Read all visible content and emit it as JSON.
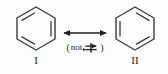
{
  "figure": {
    "type": "resonance-structure-diagram",
    "background_color": "#fdfdfd",
    "stroke_color": "#3a3a3a",
    "text_color": "#222222"
  },
  "structures": [
    {
      "id": "I",
      "name": "benzene-kekule-structure-1",
      "label": "I",
      "molecule": "benzene",
      "ring": "hexagon",
      "double_bond_edges": [
        0,
        2,
        4
      ]
    },
    {
      "id": "II",
      "name": "benzene-kekule-structure-2",
      "label": "II",
      "molecule": "benzene",
      "ring": "hexagon",
      "double_bond_edges": [
        1,
        3,
        5
      ]
    }
  ],
  "connector": {
    "name": "resonance-arrow",
    "symbol": "double-headed-arrow",
    "glyph": "↔",
    "meaning": "resonance"
  },
  "note": {
    "open_paren": "(",
    "word": "not",
    "symbol_glyph": "⇌",
    "symbol_name": "crossed-equilibrium-arrow",
    "close_paren": ")",
    "full_text": "(not ⇌)"
  }
}
